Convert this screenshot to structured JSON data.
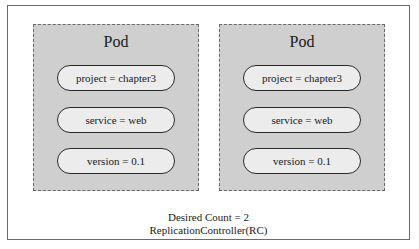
{
  "diagram": {
    "type": "ReplicationController",
    "pods": [
      {
        "title": "Pod",
        "labels": [
          "project = chapter3",
          "service = web",
          "version = 0.1"
        ]
      },
      {
        "title": "Pod",
        "labels": [
          "project = chapter3",
          "service = web",
          "version = 0.1"
        ]
      }
    ],
    "caption": {
      "desired_count": "Desired Count = 2",
      "controller_name": "ReplicationController(RC)"
    },
    "colors": {
      "pod_fill": "#cfcfcf",
      "pill_fill": "#ececec",
      "border": "#6a6a6a"
    }
  }
}
